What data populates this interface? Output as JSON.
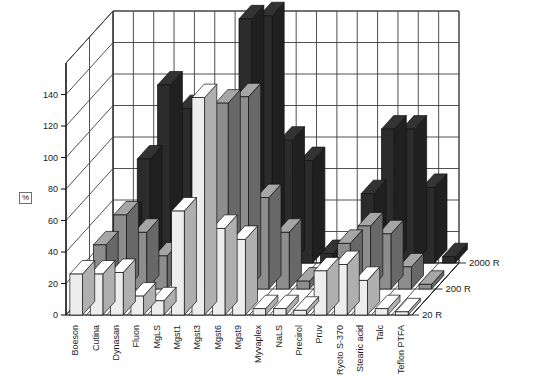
{
  "chart_data": {
    "type": "bar",
    "variant": "3d-grouped-bar",
    "title": "",
    "subtitle": "",
    "xlabel": "",
    "ylabel": "%",
    "zlabel": "",
    "ylim": [
      0,
      160
    ],
    "yticks": [
      0,
      20,
      40,
      60,
      80,
      100,
      120,
      140
    ],
    "ytick_labels": [
      "0",
      "20",
      "40",
      "60",
      "80",
      "100",
      "120",
      "140"
    ],
    "grid": true,
    "legend_position": "right-depth-axis",
    "categories": [
      "Boeson",
      "Cutina",
      "Dynasan",
      "Fluon",
      "MgLS",
      "Mgst1",
      "Mgst3",
      "Mgst6",
      "Mgst9",
      "Myvaplex",
      "NaLS",
      "Precirol",
      "Pruv",
      "Ryoto S-370",
      "Stearic acid",
      "Talc",
      "Teflon PTFA"
    ],
    "series": [
      {
        "name": "2000 R",
        "depth_index": 2,
        "fill": "#2b2b2b",
        "values": [
          30,
          66,
          113,
          98,
          34,
          25,
          155,
          157,
          78,
          65,
          6,
          5,
          44,
          85,
          85,
          48,
          4
        ]
      },
      {
        "name": "200 R",
        "depth_index": 1,
        "fill": "#8d8d8d",
        "values": [
          28,
          47,
          36,
          21,
          16,
          23,
          118,
          122,
          58,
          36,
          5,
          4,
          29,
          40,
          35,
          14,
          3
        ]
      },
      {
        "name": "20 R",
        "depth_index": 0,
        "fill": "#ededed",
        "values": [
          26,
          26,
          27,
          12,
          9,
          66,
          138,
          55,
          48,
          4,
          4,
          3,
          28,
          32,
          22,
          4,
          2
        ]
      }
    ],
    "series_names": [
      "2000 R",
      "200 R",
      "20 R"
    ]
  },
  "axis": {
    "y_unit_label": "%",
    "y_ticks": [
      "140",
      "120",
      "100",
      "80",
      "60",
      "40",
      "20",
      "0"
    ]
  },
  "legend": {
    "items": [
      "2000 R",
      "200 R",
      "20 R"
    ]
  },
  "colors": {
    "bar_back": "#2b2b2b",
    "bar_mid": "#8d8d8d",
    "bar_front": "#ededed",
    "grid": "#3d3d3d",
    "floor": "#ffffff",
    "text": "#1a1a1a"
  }
}
